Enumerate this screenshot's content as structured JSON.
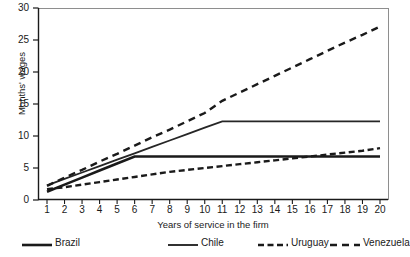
{
  "chart_data": {
    "type": "line",
    "title": "",
    "xlabel": "Years of service in the firm",
    "ylabel": "Months' wages",
    "xlim": [
      1,
      20
    ],
    "ylim": [
      0,
      30
    ],
    "xticks": [
      1,
      2,
      3,
      4,
      5,
      6,
      7,
      8,
      9,
      10,
      11,
      12,
      13,
      14,
      15,
      16,
      17,
      18,
      19,
      20
    ],
    "yticks": [
      0,
      5,
      10,
      15,
      20,
      25,
      30
    ],
    "grid": false,
    "legend_position": "bottom",
    "x": [
      1,
      2,
      3,
      4,
      5,
      6,
      7,
      8,
      9,
      10,
      11,
      12,
      13,
      14,
      15,
      16,
      17,
      18,
      19,
      20
    ],
    "series": [
      {
        "name": "Brazil",
        "style": "solid-thick",
        "color": "#1a1a1a",
        "values": [
          1.3,
          2.4,
          3.5,
          4.6,
          5.7,
          6.8,
          6.8,
          6.8,
          6.8,
          6.8,
          6.8,
          6.8,
          6.8,
          6.8,
          6.8,
          6.8,
          6.8,
          6.8,
          6.8,
          6.8
        ]
      },
      {
        "name": "Chile",
        "style": "solid-thin",
        "color": "#262626",
        "values": [
          2.3,
          3.3,
          4.3,
          5.3,
          6.3,
          7.3,
          8.3,
          9.3,
          10.3,
          11.3,
          12.3,
          12.3,
          12.3,
          12.3,
          12.3,
          12.3,
          12.3,
          12.3,
          12.3,
          12.3
        ]
      },
      {
        "name": "Uruguay",
        "style": "dashed-tight",
        "color": "#1a1a1a",
        "values": [
          1.7,
          2.0,
          2.4,
          2.8,
          3.2,
          3.6,
          4.0,
          4.4,
          4.7,
          5.0,
          5.3,
          5.6,
          5.9,
          6.2,
          6.5,
          6.8,
          7.1,
          7.4,
          7.7,
          8.1
        ]
      },
      {
        "name": "Venezuela",
        "style": "dashed-wide",
        "color": "#1a1a1a",
        "values": [
          2.2,
          3.5,
          4.7,
          6.0,
          7.2,
          8.5,
          9.8,
          11.0,
          12.3,
          13.6,
          15.5,
          16.8,
          18.1,
          19.4,
          20.7,
          22.0,
          23.3,
          24.6,
          25.8,
          27.1
        ]
      }
    ]
  },
  "axes": {
    "ylabel": "Months' wages",
    "xlabel": "Years of service in the firm",
    "ytick_labels": [
      "0",
      "5",
      "10",
      "15",
      "20",
      "25",
      "30"
    ],
    "xtick_labels": [
      "1",
      "2",
      "3",
      "4",
      "5",
      "6",
      "7",
      "8",
      "9",
      "10",
      "11",
      "12",
      "13",
      "14",
      "15",
      "16",
      "17",
      "18",
      "19",
      "20"
    ]
  },
  "legend": {
    "items": [
      {
        "label": "Brazil",
        "style": "solid-thick"
      },
      {
        "label": "Chile",
        "style": "solid-thin"
      },
      {
        "label": "Uruguay",
        "style": "dashed-tight"
      },
      {
        "label": "Venezuela",
        "style": "dashed-wide"
      }
    ]
  },
  "colors": {
    "line": "#1a1a1a",
    "axis": "#1a1a1a",
    "frame": "#8e8e8e",
    "background": "#ffffff"
  }
}
